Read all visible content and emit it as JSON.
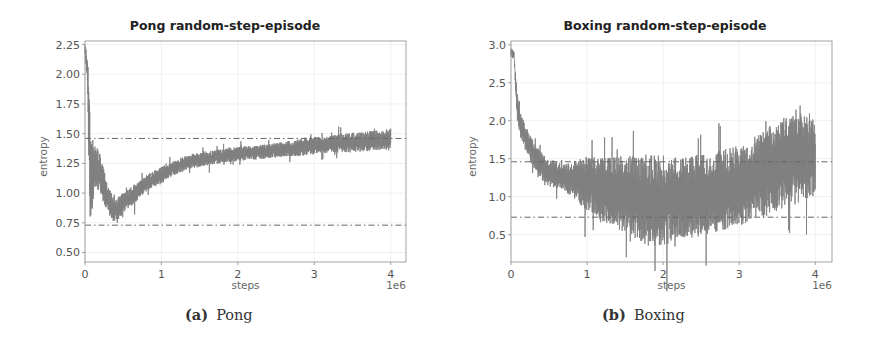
{
  "chart_data": [
    {
      "type": "line",
      "title": "Pong random-step-episode",
      "caption_tag": "(a)",
      "caption_text": "Pong",
      "xlabel": "steps",
      "x_offset_label": "1e6",
      "ylabel": "entropy",
      "xlim": [
        0,
        4.2
      ],
      "ylim": [
        0.42,
        2.28
      ],
      "xticks": [
        0,
        1,
        2,
        3,
        4
      ],
      "xtick_labels": [
        "0",
        "1",
        "2",
        "3",
        "4"
      ],
      "yticks": [
        0.5,
        0.75,
        1.0,
        1.25,
        1.5,
        1.75,
        2.0,
        2.25
      ],
      "ytick_labels": [
        "0.50",
        "0.75",
        "1.00",
        "1.25",
        "1.50",
        "1.75",
        "2.00",
        "2.25"
      ],
      "grid": true,
      "legend": null,
      "hlines": [
        {
          "y": 1.46,
          "style": "dashdot",
          "color": "#666666"
        },
        {
          "y": 0.73,
          "style": "dashdot",
          "color": "#666666"
        }
      ],
      "series": [
        {
          "name": "entropy",
          "color": "#808080",
          "x": [
            0.0,
            0.03,
            0.05,
            0.07,
            0.09,
            0.12,
            0.16,
            0.2,
            0.25,
            0.3,
            0.35,
            0.4,
            0.45,
            0.5,
            0.6,
            0.7,
            0.8,
            0.9,
            1.0,
            1.1,
            1.2,
            1.3,
            1.4,
            1.5,
            1.6,
            1.7,
            1.8,
            1.9,
            2.0,
            2.2,
            2.4,
            2.6,
            2.8,
            3.0,
            3.2,
            3.4,
            3.6,
            3.8,
            4.0
          ],
          "mean": [
            2.2,
            2.05,
            1.6,
            1.2,
            1.1,
            1.25,
            1.2,
            1.15,
            1.05,
            0.95,
            0.88,
            0.85,
            0.88,
            0.92,
            0.97,
            1.02,
            1.08,
            1.12,
            1.15,
            1.19,
            1.22,
            1.25,
            1.27,
            1.28,
            1.29,
            1.3,
            1.31,
            1.32,
            1.33,
            1.34,
            1.35,
            1.37,
            1.38,
            1.4,
            1.41,
            1.42,
            1.43,
            1.44,
            1.46
          ],
          "spread": [
            0.05,
            0.1,
            0.3,
            0.35,
            0.3,
            0.15,
            0.15,
            0.14,
            0.12,
            0.1,
            0.09,
            0.08,
            0.08,
            0.07,
            0.07,
            0.06,
            0.06,
            0.06,
            0.06,
            0.05,
            0.05,
            0.05,
            0.05,
            0.05,
            0.05,
            0.05,
            0.05,
            0.05,
            0.05,
            0.05,
            0.05,
            0.05,
            0.06,
            0.06,
            0.06,
            0.07,
            0.07,
            0.07,
            0.07
          ]
        }
      ]
    },
    {
      "type": "line",
      "title": "Boxing random-step-episode",
      "caption_tag": "(b)",
      "caption_text": "Boxing",
      "xlabel": "steps",
      "x_offset_label": "1e6",
      "ylabel": "entropy",
      "xlim": [
        0,
        4.22
      ],
      "ylim": [
        0.14,
        3.05
      ],
      "xticks": [
        0,
        1,
        2,
        3,
        4
      ],
      "xtick_labels": [
        "0",
        "1",
        "2",
        "3",
        "4"
      ],
      "yticks": [
        0.5,
        1.0,
        1.5,
        2.0,
        2.5,
        3.0
      ],
      "ytick_labels": [
        "0.5",
        "1.0",
        "1.5",
        "2.0",
        "2.5",
        "3.0"
      ],
      "grid": true,
      "legend": null,
      "hlines": [
        {
          "y": 1.46,
          "style": "dashdot",
          "color": "#666666"
        },
        {
          "y": 0.73,
          "style": "dashdot",
          "color": "#666666"
        }
      ],
      "series": [
        {
          "name": "entropy",
          "color": "#808080",
          "x": [
            0.0,
            0.04,
            0.08,
            0.12,
            0.2,
            0.3,
            0.4,
            0.5,
            0.6,
            0.7,
            0.8,
            0.9,
            1.0,
            1.2,
            1.4,
            1.6,
            1.8,
            2.0,
            2.2,
            2.4,
            2.6,
            2.8,
            3.0,
            3.2,
            3.4,
            3.6,
            3.8,
            4.0
          ],
          "mean": [
            2.9,
            2.85,
            2.2,
            1.95,
            1.75,
            1.55,
            1.4,
            1.32,
            1.28,
            1.25,
            1.22,
            1.2,
            1.18,
            1.1,
            1.05,
            1.0,
            0.95,
            0.95,
            0.97,
            1.0,
            1.05,
            1.1,
            1.15,
            1.25,
            1.35,
            1.45,
            1.5,
            1.55
          ],
          "spread": [
            0.05,
            0.05,
            0.15,
            0.15,
            0.15,
            0.15,
            0.15,
            0.15,
            0.15,
            0.15,
            0.2,
            0.25,
            0.3,
            0.35,
            0.4,
            0.45,
            0.5,
            0.5,
            0.45,
            0.45,
            0.45,
            0.45,
            0.45,
            0.45,
            0.5,
            0.5,
            0.5,
            0.45
          ]
        }
      ]
    }
  ]
}
